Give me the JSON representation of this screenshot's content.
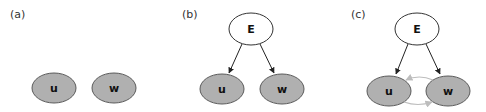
{
  "colors": {
    "observed_fill": "#b0b0b0",
    "observed_stroke": "#5a5a5a",
    "latent_fill": "#ffffff",
    "latent_stroke": "#333333",
    "edge": "#222222",
    "undirected_edge": "#bdbdbd"
  },
  "panels": [
    {
      "label": "(a)",
      "nodes": [
        {
          "id": "u",
          "label": "u",
          "observed": true
        },
        {
          "id": "w",
          "label": "w",
          "observed": true
        }
      ],
      "edges": []
    },
    {
      "label": "(b)",
      "nodes": [
        {
          "id": "E",
          "label": "E",
          "observed": false
        },
        {
          "id": "u",
          "label": "u",
          "observed": true
        },
        {
          "id": "w",
          "label": "w",
          "observed": true
        }
      ],
      "edges": [
        {
          "from": "E",
          "to": "u",
          "type": "directed"
        },
        {
          "from": "E",
          "to": "w",
          "type": "directed"
        }
      ]
    },
    {
      "label": "(c)",
      "nodes": [
        {
          "id": "E",
          "label": "E",
          "observed": false
        },
        {
          "id": "u",
          "label": "u",
          "observed": true
        },
        {
          "id": "w",
          "label": "w",
          "observed": true
        }
      ],
      "edges": [
        {
          "from": "E",
          "to": "u",
          "type": "directed"
        },
        {
          "from": "E",
          "to": "w",
          "type": "directed"
        },
        {
          "from": "w",
          "to": "u",
          "type": "directed-light"
        },
        {
          "from": "u",
          "to": "w",
          "type": "directed-light"
        }
      ]
    }
  ]
}
